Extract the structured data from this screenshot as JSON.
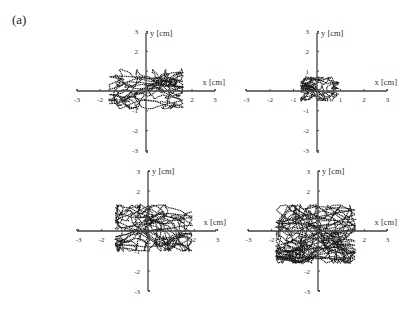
{
  "figure": {
    "panel_label": "(a)"
  },
  "chart_data": [
    {
      "type": "scatter",
      "subtype": "trajectory",
      "position": "top-left",
      "title": "",
      "xlabel": "x [cm]",
      "ylabel": "y [cm]",
      "xlim": [
        -3,
        3
      ],
      "ylim": [
        -3,
        3
      ],
      "xticks": [
        "-3",
        "-2",
        "-1",
        "1",
        "2",
        "3"
      ],
      "yticks": [
        "3",
        "2",
        "1",
        "-1",
        "-2",
        "-3"
      ],
      "grid": false,
      "approx_extent": {
        "x": [
          -1.6,
          1.6
        ],
        "y": [
          -0.9,
          1.1
        ]
      },
      "seed": 11,
      "spread": [
        0.55,
        0.35
      ],
      "n_points": 900
    },
    {
      "type": "scatter",
      "subtype": "trajectory",
      "position": "top-right",
      "title": "",
      "xlabel": "x [cm]",
      "ylabel": "y [cm]",
      "xlim": [
        -3,
        3
      ],
      "ylim": [
        -3,
        3
      ],
      "xticks": [
        "-3",
        "-2",
        "-1",
        "1",
        "2",
        "3"
      ],
      "yticks": [
        "3",
        "2",
        "1",
        "-1",
        "-2",
        "-3"
      ],
      "grid": false,
      "approx_extent": {
        "x": [
          -0.7,
          0.9
        ],
        "y": [
          -0.5,
          0.7
        ]
      },
      "seed": 23,
      "spread": [
        0.3,
        0.22
      ],
      "n_points": 700
    },
    {
      "type": "scatter",
      "subtype": "trajectory",
      "position": "bottom-left",
      "title": "",
      "xlabel": "x [cm]",
      "ylabel": "y [cm]",
      "xlim": [
        -3,
        3
      ],
      "ylim": [
        -3,
        3
      ],
      "xticks": [
        "-3",
        "-2",
        "-1",
        "1",
        "2",
        "3"
      ],
      "yticks": [
        "3",
        "2",
        "1",
        "-1",
        "-2",
        "-3"
      ],
      "grid": false,
      "approx_extent": {
        "x": [
          -1.4,
          1.9
        ],
        "y": [
          -1.0,
          1.3
        ]
      },
      "seed": 37,
      "spread": [
        0.6,
        0.45
      ],
      "n_points": 1100
    },
    {
      "type": "scatter",
      "subtype": "trajectory",
      "position": "bottom-right",
      "title": "",
      "xlabel": "x [cm]",
      "ylabel": "y [cm]",
      "xlim": [
        -3,
        3
      ],
      "ylim": [
        -3,
        3
      ],
      "xticks": [
        "-3",
        "-2",
        "-1",
        "1",
        "2",
        "3"
      ],
      "yticks": [
        "3",
        "2",
        "1",
        "-1",
        "-2",
        "-3"
      ],
      "grid": false,
      "approx_extent": {
        "x": [
          -1.8,
          1.6
        ],
        "y": [
          -1.6,
          1.3
        ]
      },
      "seed": 53,
      "spread": [
        0.8,
        0.65
      ],
      "n_points": 1300
    }
  ]
}
